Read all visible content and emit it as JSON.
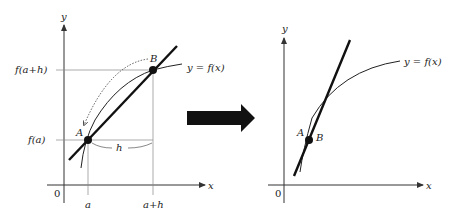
{
  "left_panel": {
    "axis_x_label": "x",
    "axis_y_label": "y",
    "origin_label": "0",
    "curve_label": "y = f(x)",
    "point_a_label": "A",
    "point_b_label": "B",
    "y_tick_upper": "f(a+h)",
    "y_tick_lower": "f(a)",
    "x_tick_left": "a",
    "x_tick_right": "a+h",
    "interval_label": "h"
  },
  "transition_arrow": {
    "direction": "right",
    "color": "#111111"
  },
  "right_panel": {
    "axis_x_label": "x",
    "axis_y_label": "y",
    "origin_label": "0",
    "curve_label": "y = f(x)",
    "point_a_label": "A",
    "point_b_label": "B"
  },
  "colors": {
    "line": "#111111",
    "guide": "#777777",
    "text": "#222222"
  }
}
